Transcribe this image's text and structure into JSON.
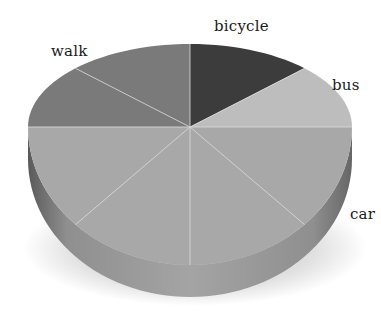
{
  "chart_data": {
    "type": "pie",
    "style": "3d-perspective",
    "title": "",
    "categories": [
      "bicycle",
      "bus",
      "car",
      "walk"
    ],
    "values": [
      12.5,
      12.5,
      50,
      25
    ],
    "unit": "percent",
    "wedge_divisions": [
      1,
      1,
      4,
      2
    ],
    "start_angle_deg": 0,
    "direction": "clockwise-from-top",
    "colors": {
      "bicycle": "#3c3c3c",
      "bus": "#bdbdbd",
      "car": "#a8a8a8",
      "walk": "#7a7a7a"
    },
    "side_color": "#9a9a9a",
    "divider_color": "#d8d8d8",
    "legend": "none",
    "labels_position": "outside-slice"
  },
  "labels": {
    "bicycle": "bicycle",
    "bus": "bus",
    "car": "car",
    "walk": "walk"
  }
}
